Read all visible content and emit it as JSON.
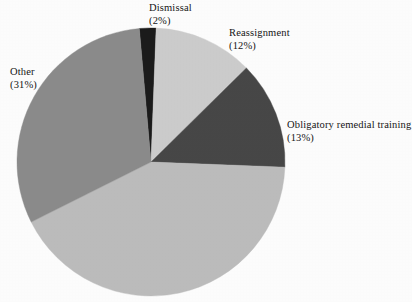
{
  "chart_data": {
    "type": "pie",
    "title": "",
    "subtitle": "",
    "xlabel": "",
    "ylabel": "",
    "grid": false,
    "legend_position": "none",
    "label_format": "name + (percent%)",
    "start_angle_deg": -95,
    "direction": "clockwise",
    "categories": [
      "Dismissal",
      "Reassignment",
      "Obligatory remedial training",
      "Unlabeled",
      "Other"
    ],
    "values": [
      2,
      12,
      13,
      42,
      31
    ],
    "units": "percent",
    "slices": [
      {
        "name": "Dismissal",
        "percent": 2,
        "percent_text": "(2%)",
        "color": "#1b1b1b",
        "labeled": true,
        "label_position": "top"
      },
      {
        "name": "Reassignment",
        "percent": 12,
        "percent_text": "(12%)",
        "color": "#cccccc",
        "labeled": true,
        "label_position": "top-right"
      },
      {
        "name": "Obligatory remedial training",
        "percent": 13,
        "percent_text": "(13%)",
        "color": "#474747",
        "labeled": true,
        "label_position": "right"
      },
      {
        "name": "",
        "percent": 42,
        "percent_text": "",
        "color": "#bcbcbc",
        "labeled": false,
        "label_position": "none"
      },
      {
        "name": "Other",
        "percent": 31,
        "percent_text": "(31%)",
        "color": "#8b8b8b",
        "labeled": true,
        "label_position": "left"
      }
    ],
    "labels": [
      {
        "name": "Dismissal",
        "percent_text": "(2%)"
      },
      {
        "name": "Reassignment",
        "percent_text": "(12%)"
      },
      {
        "name": "Obligatory remedial training",
        "percent_text": "(13%)"
      },
      {
        "name": "Other",
        "percent_text": "(31%)"
      }
    ],
    "geometry": {
      "center_x": 151,
      "center_y": 162,
      "radius": 134
    },
    "background_color": "#fdfdfd",
    "text_color": "#151515"
  }
}
